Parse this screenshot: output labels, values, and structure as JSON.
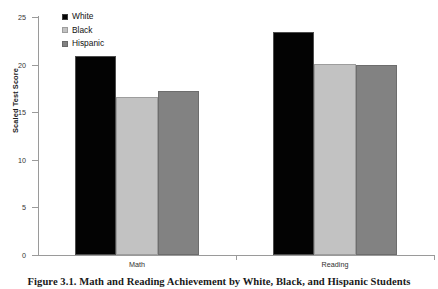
{
  "chart_data": {
    "type": "bar",
    "title": "",
    "xlabel": "",
    "ylabel": "Scaled Test Score",
    "ylim": [
      0,
      25
    ],
    "yticks": [
      0,
      5,
      10,
      15,
      20,
      25
    ],
    "ytick_labels": [
      "0",
      "5",
      "10",
      "15",
      "20",
      "25"
    ],
    "grid": false,
    "legend_position": "top-left inside plot",
    "categories": [
      "Math",
      "Reading"
    ],
    "series": [
      {
        "name": "White",
        "color": "#030303",
        "values": [
          20.9,
          23.4
        ]
      },
      {
        "name": "Black",
        "color": "#c2c2c2",
        "values": [
          16.6,
          20.1
        ]
      },
      {
        "name": "Hispanic",
        "color": "#828282",
        "values": [
          17.2,
          20.0
        ]
      }
    ]
  },
  "legend": {
    "entries": [
      {
        "label": "White",
        "swatch": "legend-swatch-black-fill"
      },
      {
        "label": "Black",
        "swatch": "legend-swatch-light-gray-fill"
      },
      {
        "label": "Hispanic",
        "swatch": "legend-swatch-medium-gray-fill"
      }
    ]
  },
  "caption": {
    "text": "Figure 3.1. Math and Reading Achievement by White, Black, and Hispanic Students"
  }
}
